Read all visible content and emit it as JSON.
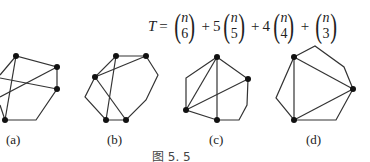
{
  "formula": {
    "lhs": "T",
    "equals": "=",
    "terms": [
      {
        "coef": "",
        "top": "n",
        "bottom": "6"
      },
      {
        "coef": "5",
        "top": "n",
        "bottom": "5"
      },
      {
        "coef": "4",
        "top": "n",
        "bottom": "4"
      },
      {
        "coef": "",
        "top": "n",
        "bottom": "3"
      }
    ],
    "plus": "+"
  },
  "figures": [
    {
      "label": "(a)"
    },
    {
      "label": "(b)"
    },
    {
      "label": "(c)"
    },
    {
      "label": "(d)"
    }
  ],
  "caption": "图 5. 5"
}
